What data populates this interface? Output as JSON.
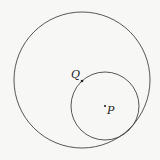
{
  "diagram": {
    "background": "#f7f7f5",
    "stroke_color": "#444444",
    "large_circle": {
      "cx": 82,
      "cy": 80,
      "r": 68
    },
    "small_circle": {
      "cx": 105,
      "cy": 106,
      "r": 34
    },
    "points": [
      {
        "label": "Q",
        "x": 82,
        "y": 81
      },
      {
        "label": "P",
        "x": 105,
        "y": 106
      }
    ]
  }
}
